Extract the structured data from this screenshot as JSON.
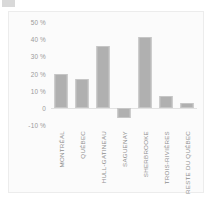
{
  "figure": {
    "background_color": "#fbfbfb",
    "border_color": "#ececec",
    "bar_color": "#b0b0b0",
    "bar_edge_color": "#c6c6c6",
    "tick_text_color": "#9a9a9a",
    "label_text_color": "#8f8f8f"
  },
  "chart_data": {
    "type": "bar",
    "title": "",
    "subtitle": "",
    "xlabel": "",
    "ylabel": "",
    "categories": [
      "MONTRÉAL",
      "QUÉBEC",
      "HULL-GATINEAU",
      "SAGUENAY",
      "SHERBROOKE",
      "TROIS-RIVIÈRES",
      "RESTE DU QUÉBEC"
    ],
    "values": [
      20,
      17,
      36,
      -6,
      41,
      7,
      3
    ],
    "ylim": [
      -10,
      50
    ],
    "yticks": [
      50,
      40,
      30,
      20,
      10,
      0,
      -10
    ],
    "ytick_labels": [
      "50 %",
      "40 %",
      "30 %",
      "20 %",
      "10 %",
      "0",
      "-10 %"
    ],
    "grid": false,
    "legend": null,
    "annotations": [],
    "orientation": "vertical",
    "xtick_label_rotation": 90
  }
}
